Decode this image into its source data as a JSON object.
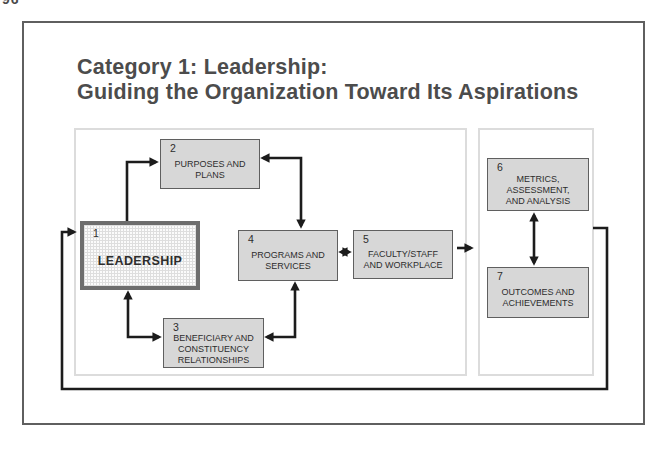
{
  "page": {
    "corner_fragment": "96"
  },
  "title": {
    "line1": "Category 1: Leadership:",
    "line2": "Guiding the Organization Toward Its Aspirations"
  },
  "boxes": [
    {
      "number": "1",
      "lines": [
        "LEADERSHIP"
      ]
    },
    {
      "number": "2",
      "lines": [
        "PURPOSES AND",
        "PLANS"
      ]
    },
    {
      "number": "3",
      "lines": [
        "BENEFICIARY AND",
        "CONSTITUENCY",
        "RELATIONSHIPS"
      ]
    },
    {
      "number": "4",
      "lines": [
        "PROGRAMS AND",
        "SERVICES"
      ]
    },
    {
      "number": "5",
      "lines": [
        "FACULTY/STAFF",
        "AND WORKPLACE"
      ]
    },
    {
      "number": "6",
      "lines": [
        "METRICS,",
        "ASSESSMENT,",
        "AND ANALYSIS"
      ]
    },
    {
      "number": "7",
      "lines": [
        "OUTCOMES AND",
        "ACHIEVEMENTS"
      ]
    }
  ],
  "connections": [
    {
      "from": "1",
      "to": "2",
      "type": "one-way"
    },
    {
      "from": "2",
      "to": "4",
      "type": "two-way"
    },
    {
      "from": "1",
      "to": "3",
      "type": "two-way"
    },
    {
      "from": "3",
      "to": "4",
      "type": "two-way"
    },
    {
      "from": "4",
      "to": "5",
      "type": "two-way"
    },
    {
      "from": "5",
      "to": "results-panel",
      "type": "one-way"
    },
    {
      "from": "6",
      "to": "7",
      "type": "two-way"
    },
    {
      "from": "results-panel",
      "to": "1",
      "type": "feedback-loop"
    }
  ],
  "colors": {
    "box_fill": "#d7d7d7",
    "box_border": "#5f5f5f",
    "box_text": "#2d2d2d",
    "arrow": "#1c1c1c",
    "title_text": "#4c4c4c",
    "panel_border": "#dcdcdc",
    "frame_border": "#5f5f5f"
  }
}
